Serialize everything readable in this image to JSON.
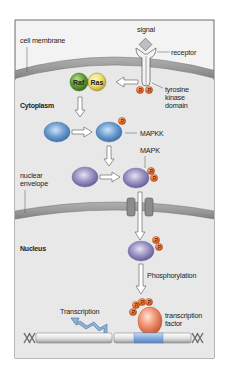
{
  "diagram": {
    "regions": {
      "cytoplasm": "Cytoplasm",
      "nucleus": "Nucleus"
    },
    "labels": {
      "cell_membrane": "cell membrane",
      "signal": "signal",
      "receptor": "receptor",
      "tyrosine_kinase_line1": "tyrosine",
      "tyrosine_kinase_line2": "kinase",
      "tyrosine_kinase_line3": "domain",
      "mapkk": "MAPKK",
      "mapk": "MAPK",
      "nuclear_envelope_line1": "nuclear",
      "nuclear_envelope_line2": "envelope",
      "phosphorylation": "Phosphorylation",
      "transcription": "Transcription",
      "transcription_factor_line1": "transcription",
      "transcription_factor_line2": "factor"
    },
    "proteins": {
      "raf": "Raf",
      "ras": "Ras"
    },
    "phosphate_symbol": "P",
    "colors": {
      "background": "#ececec",
      "membrane": "#9a9a9a",
      "raf": "#5a9a2e",
      "ras": "#e6d65a",
      "mapkk": "#5d8fc4",
      "mapk": "#8f86b8",
      "transcription_factor": "#ee8a6a",
      "phosphate": "#e0702e",
      "dna_highlight": "#7aa5d6",
      "transcription_arrow": "#7ea3cf"
    },
    "nodes": [
      {
        "id": "signal",
        "label": "signal"
      },
      {
        "id": "receptor",
        "label": "receptor"
      },
      {
        "id": "ras",
        "label": "Ras"
      },
      {
        "id": "raf",
        "label": "Raf"
      },
      {
        "id": "mapkk",
        "label": "MAPKK"
      },
      {
        "id": "mapk",
        "label": "MAPK"
      },
      {
        "id": "transcription_factor",
        "label": "transcription factor"
      }
    ],
    "edges": [
      {
        "from": "signal",
        "to": "receptor"
      },
      {
        "from": "receptor",
        "to": "ras"
      },
      {
        "from": "raf",
        "to": "mapkk"
      },
      {
        "from": "mapkk",
        "to": "mapk"
      },
      {
        "from": "mapk",
        "to": "nucleus"
      },
      {
        "from": "mapk",
        "to": "transcription_factor",
        "label": "Phosphorylation"
      },
      {
        "from": "transcription_factor",
        "to": "dna",
        "label": "Transcription"
      }
    ]
  }
}
